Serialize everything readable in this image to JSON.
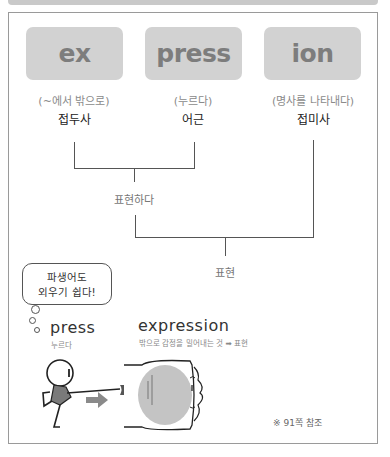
{
  "parts": [
    {
      "word": "ex",
      "meaning": "(~에서 밖으로)",
      "role": "접두사"
    },
    {
      "word": "press",
      "meaning": "(누르다)",
      "role": "어근"
    },
    {
      "word": "ion",
      "meaning": "(명사를 나타내다)",
      "role": "접미사"
    }
  ],
  "tree": {
    "intermediate": "표현하다",
    "result": "표현"
  },
  "bubble": {
    "line1": "파생어도",
    "line2": "외우기 쉽다!"
  },
  "examples": {
    "base": {
      "word": "press",
      "gloss": "누르다"
    },
    "derived": {
      "word": "expression",
      "gloss": "밖으로 감정을 밀어내는 것 ➡ 표현"
    }
  },
  "note": "※ 91쪽 참조",
  "colors": {
    "box": "#d2d2d2",
    "box_text": "#7d7d7d",
    "line": "#555555",
    "illustration_gray": "#8a8a8a"
  }
}
